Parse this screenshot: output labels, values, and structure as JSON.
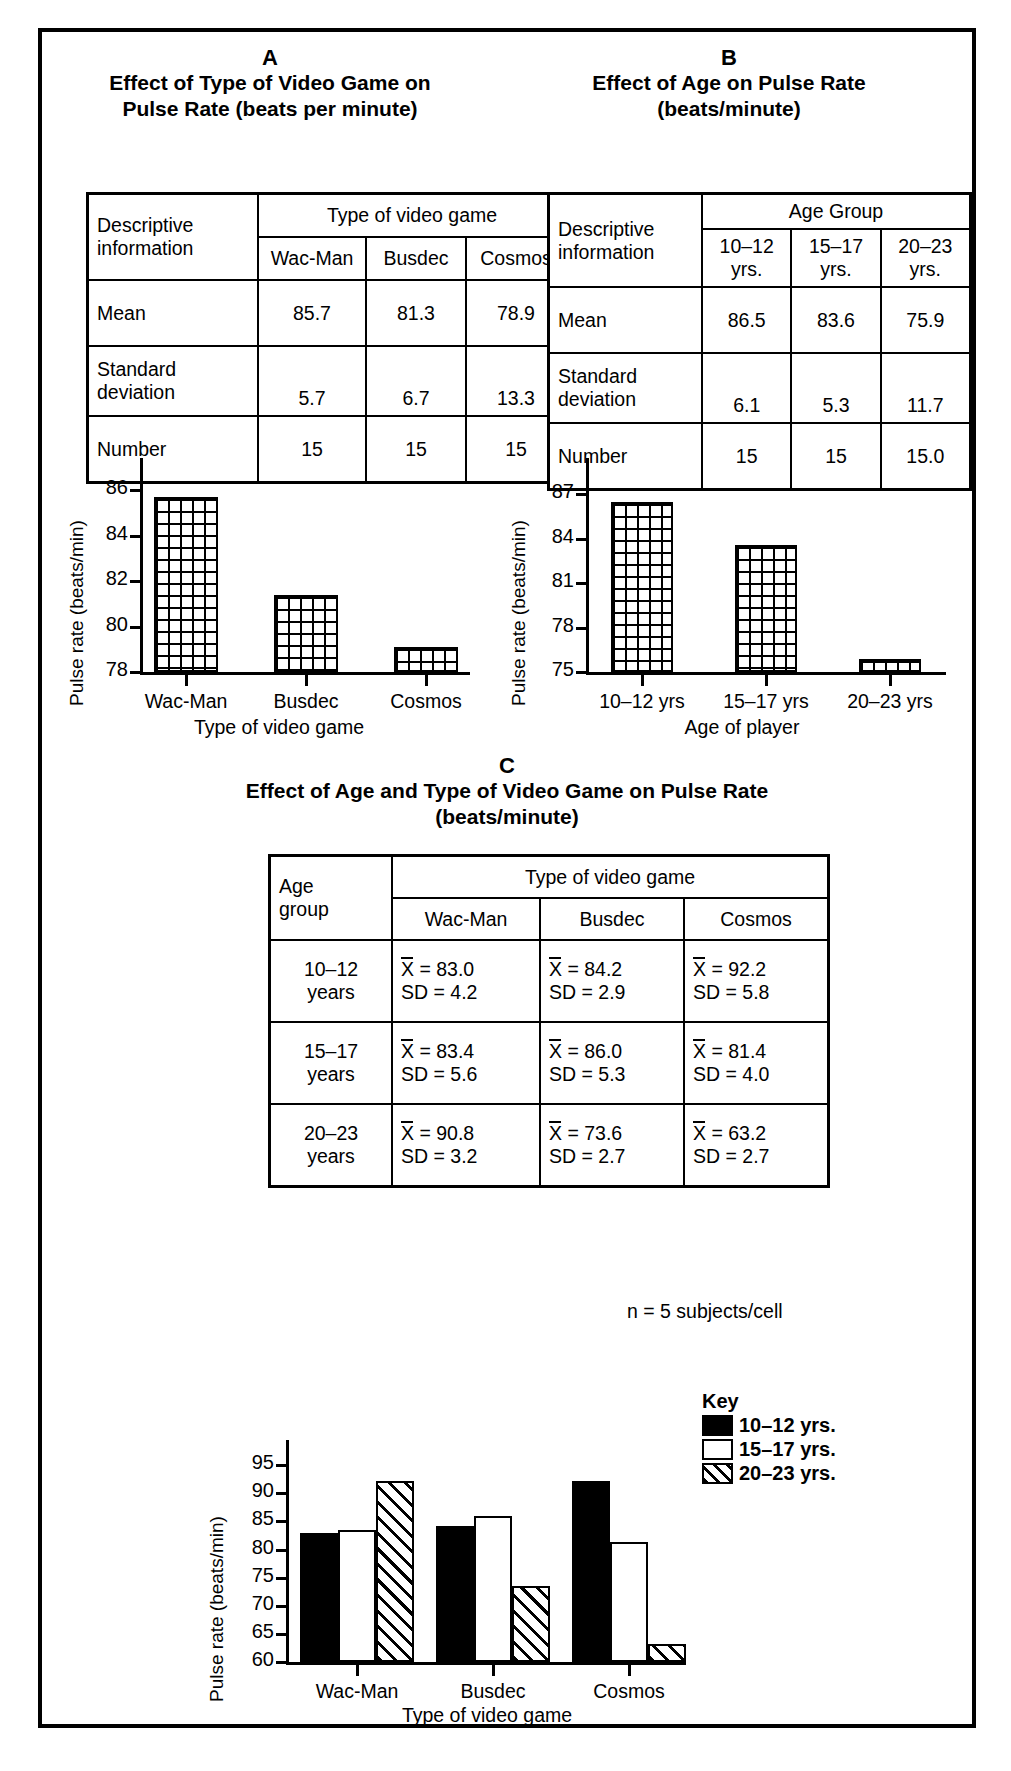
{
  "top_fragment": "— — — — — — — — — playing — — — — — — — — — —",
  "panels": {
    "a": {
      "letter": "A",
      "title_lines": [
        "Effect of Type of Video Game on",
        "Pulse Rate (beats per minute)"
      ],
      "table": {
        "row_header": [
          "Descriptive",
          "information"
        ],
        "group_header": "Type of video game",
        "columns": [
          "Wac-Man",
          "Busdec",
          "Cosmos"
        ],
        "rows": [
          {
            "label": [
              "Mean"
            ],
            "values": [
              "85.7",
              "81.3",
              "78.9"
            ]
          },
          {
            "label": [
              "Standard",
              "deviation"
            ],
            "values": [
              "5.7",
              "6.7",
              "13.3"
            ]
          },
          {
            "label": [
              "Number"
            ],
            "values": [
              "15",
              "15",
              "15"
            ]
          }
        ]
      }
    },
    "b": {
      "letter": "B",
      "title_lines": [
        "Effect of Age on Pulse Rate",
        "(beats/minute)"
      ],
      "table": {
        "row_header": [
          "Descriptive",
          "information"
        ],
        "group_header": "Age Group",
        "columns": [
          [
            "10–12",
            "yrs."
          ],
          [
            "15–17",
            "yrs."
          ],
          [
            "20–23",
            "yrs."
          ]
        ],
        "rows": [
          {
            "label": [
              "Mean"
            ],
            "values": [
              "86.5",
              "83.6",
              "75.9"
            ]
          },
          {
            "label": [
              "Standard",
              "deviation"
            ],
            "values": [
              "6.1",
              "5.3",
              "11.7"
            ]
          },
          {
            "label": [
              "Number"
            ],
            "values": [
              "15",
              "15",
              "15.0"
            ]
          }
        ]
      }
    },
    "c": {
      "letter": "C",
      "title_lines": [
        "Effect of Age and Type of Video Game on Pulse Rate",
        "(beats/minute)"
      ],
      "table": {
        "row_header": [
          "Age",
          "group"
        ],
        "group_header": "Type of video game",
        "columns": [
          "Wac-Man",
          "Busdec",
          "Cosmos"
        ],
        "rows": [
          {
            "label": [
              "10–12",
              "years"
            ],
            "cells": [
              {
                "mean": "= 83.0",
                "sd": "SD = 4.2"
              },
              {
                "mean": "= 84.2",
                "sd": "SD = 2.9"
              },
              {
                "mean": "= 92.2",
                "sd": "SD = 5.8"
              }
            ]
          },
          {
            "label": [
              "15–17",
              "years"
            ],
            "cells": [
              {
                "mean": "= 83.4",
                "sd": "SD = 5.6"
              },
              {
                "mean": "= 86.0",
                "sd": "SD = 5.3"
              },
              {
                "mean": "= 81.4",
                "sd": "SD = 4.0"
              }
            ]
          },
          {
            "label": [
              "20–23",
              "years"
            ],
            "cells": [
              {
                "mean": "= 90.8",
                "sd": "SD = 3.2"
              },
              {
                "mean": "= 73.6",
                "sd": "SD = 2.7"
              },
              {
                "mean": "= 63.2",
                "sd": "SD = 2.7"
              }
            ]
          }
        ],
        "mean_symbol": "X",
        "footnote": "n = 5 subjects/cell"
      },
      "key": {
        "title": "Key",
        "entries": [
          {
            "label": "10–12 yrs.",
            "style": "solid"
          },
          {
            "label": "15–17 yrs.",
            "style": "open"
          },
          {
            "label": "20–23 yrs.",
            "style": "hatch"
          }
        ]
      }
    }
  },
  "chart_data": [
    {
      "id": "chart-a",
      "type": "bar",
      "title": "",
      "xlabel": "Type of video game",
      "ylabel": "Pulse rate (beats/min)",
      "categories": [
        "Wac-Man",
        "Busdec",
        "Cosmos"
      ],
      "values": [
        85.7,
        81.4,
        79.1
      ],
      "ylim": [
        78,
        86.8
      ],
      "yticks": [
        78,
        80,
        82,
        84,
        86
      ],
      "ytick_labels": [
        "78",
        "80",
        "82",
        "84",
        "86"
      ],
      "grid": false,
      "legend": "none",
      "bar_style": "mesh"
    },
    {
      "id": "chart-b",
      "type": "bar",
      "title": "",
      "xlabel": "Age of player",
      "ylabel": "Pulse rate (beats/min)",
      "categories": [
        "10–12 yrs",
        "15–17 yrs",
        "20–23 yrs"
      ],
      "values": [
        86.5,
        83.6,
        75.9
      ],
      "ylim": [
        75,
        88.5
      ],
      "yticks": [
        75,
        78,
        81,
        84,
        87
      ],
      "ytick_labels": [
        "75",
        "78",
        "81",
        "84",
        "87"
      ],
      "grid": false,
      "legend": "none",
      "bar_style": "mesh"
    },
    {
      "id": "chart-c",
      "type": "bar",
      "title": "",
      "xlabel": "Type of video game",
      "ylabel": "Pulse rate (beats/min)",
      "categories": [
        "Wac-Man",
        "Busdec",
        "Cosmos"
      ],
      "series": [
        {
          "name": "10–12 yrs.",
          "values": [
            83.0,
            84.2,
            92.2
          ],
          "style": "solid"
        },
        {
          "name": "15–17 yrs.",
          "values": [
            83.4,
            86.0,
            81.4
          ],
          "style": "open"
        },
        {
          "name": "20–23 yrs.",
          "values": [
            92.2,
            73.6,
            63.2
          ],
          "style": "hatch"
        }
      ],
      "ylim": [
        60,
        97
      ],
      "yticks": [
        60,
        65,
        70,
        75,
        80,
        85,
        90,
        95
      ],
      "ytick_labels": [
        "60",
        "65",
        "70",
        "75",
        "80",
        "85",
        "90",
        "95"
      ],
      "grid": false,
      "legend": "top-right"
    }
  ]
}
